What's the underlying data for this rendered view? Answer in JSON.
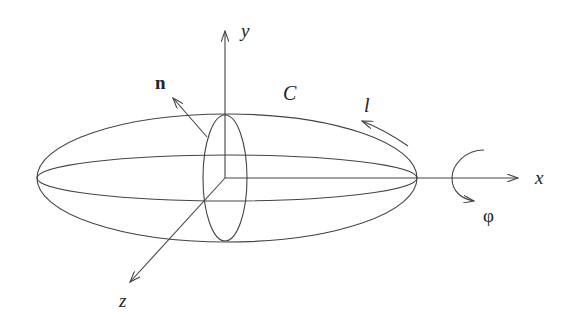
{
  "diagram": {
    "type": "ellipsoid-coordinate-diagram",
    "labels": {
      "x_axis": "x",
      "y_axis": "y",
      "z_axis": "z",
      "normal": "n",
      "contour": "C",
      "arc_length": "l",
      "angle": "φ"
    },
    "colors": {
      "line": "#444444",
      "text": "#222222",
      "background": "#ffffff"
    }
  }
}
